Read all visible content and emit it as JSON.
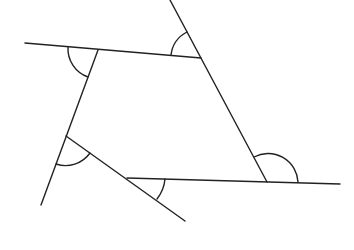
{
  "diagram": {
    "stroke_color": "#222222",
    "background": "#ffffff",
    "vertices": [
      {
        "id": "A",
        "x": 98,
        "y": 50
      },
      {
        "id": "B",
        "x": 201,
        "y": 58
      },
      {
        "id": "C",
        "x": 267,
        "y": 182
      },
      {
        "id": "D",
        "x": 127,
        "y": 178
      },
      {
        "id": "E",
        "x": 66,
        "y": 136
      }
    ],
    "lines": [
      {
        "name": "top-side-extended",
        "x1": 25,
        "y1": 43,
        "x2": 201,
        "y2": 58
      },
      {
        "name": "right-side-extended",
        "x1": 170,
        "y1": 0,
        "x2": 267,
        "y2": 182
      },
      {
        "name": "bottom-side-extended",
        "x1": 127,
        "y1": 178,
        "x2": 340,
        "y2": 184
      },
      {
        "name": "lower-left-side-extended",
        "x1": 66,
        "y1": 136,
        "x2": 185,
        "y2": 221
      },
      {
        "name": "left-side-extended",
        "x1": 98,
        "y1": 50,
        "x2": 41,
        "y2": 205
      }
    ],
    "angle_marks": [
      {
        "vertex": "A",
        "path": "M 68 47 A 30 30 0 0 0 88 77"
      },
      {
        "vertex": "B",
        "path": "M 171 55 A 30 30 0 0 1 187 32"
      },
      {
        "vertex": "C",
        "path": "M 254 157 A 30 30 0 0 1 298 182"
      },
      {
        "vertex": "D",
        "path": "M 165 179 A 38 38 0 0 1 157 199"
      },
      {
        "vertex": "E",
        "path": "M 56 164 A 30 30 0 0 0 90 153"
      }
    ]
  }
}
